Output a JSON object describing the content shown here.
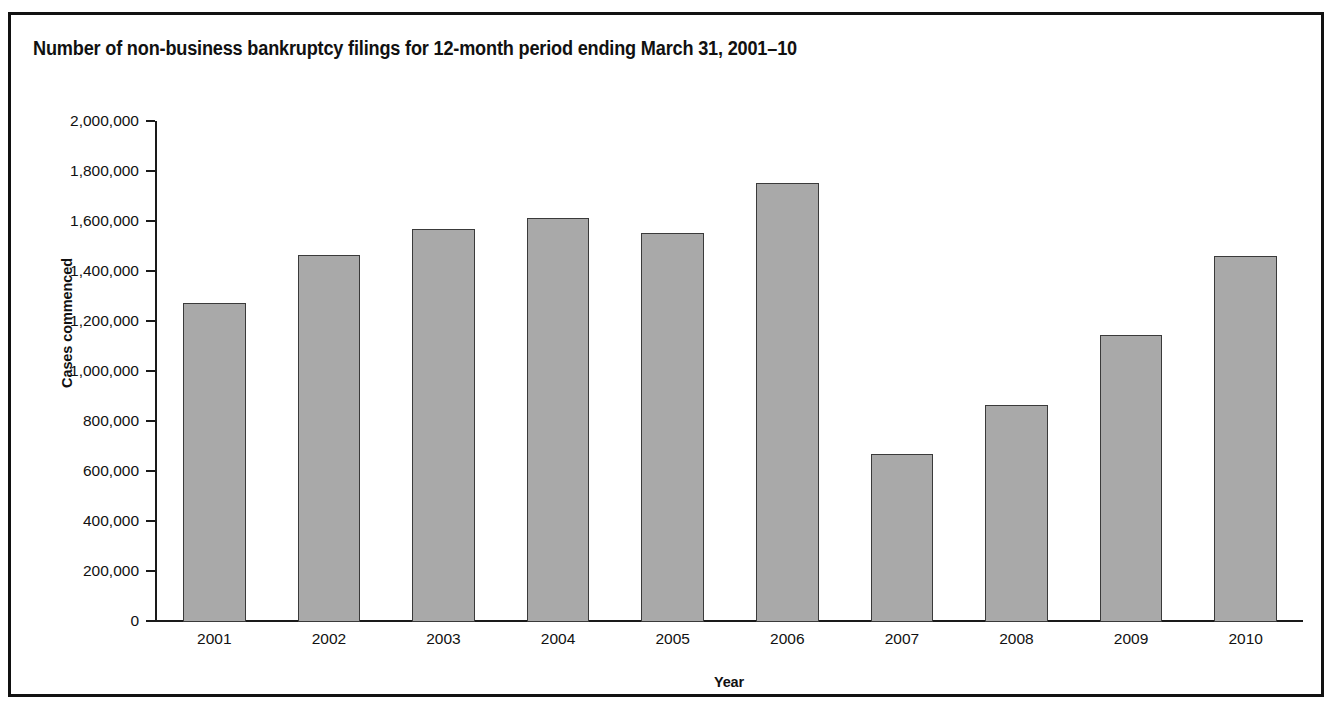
{
  "figure": {
    "title": "Number of non-business bankruptcy filings for 12-month period ending March 31, 2001–10",
    "frame_color": "#111111",
    "bar_fill_color": "#a9a9a9",
    "bar_edge_color": "#3a3a3a",
    "background_color": "#ffffff"
  },
  "chart_data": {
    "type": "bar",
    "title": "Number of non-business bankruptcy filings for 12-month period ending March 31, 2001–10",
    "xlabel": "Year",
    "ylabel": "Cases commenced",
    "categories": [
      "2001",
      "2002",
      "2003",
      "2004",
      "2005",
      "2006",
      "2007",
      "2008",
      "2009",
      "2010"
    ],
    "values": [
      1277000,
      1467000,
      1573000,
      1618000,
      1556000,
      1757000,
      671000,
      868000,
      1149000,
      1463000
    ],
    "ylim": [
      0,
      2000000
    ],
    "ytick_labels": [
      "2,000,000",
      "1,800,000",
      "1,600,000",
      "1,400,000",
      "1,200,000",
      "1,000,000",
      "800,000",
      "600,000",
      "400,000",
      "200,000",
      "0"
    ],
    "ytick_values": [
      2000000,
      1800000,
      1600000,
      1400000,
      1200000,
      1000000,
      800000,
      600000,
      400000,
      200000,
      0
    ],
    "grid": false,
    "legend": null,
    "legend_position": "none"
  }
}
